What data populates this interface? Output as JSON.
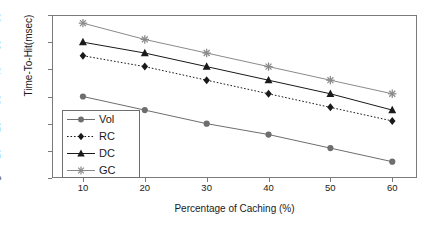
{
  "chart_data": {
    "type": "line",
    "title": "",
    "xlabel": "Percentage of Caching (%)",
    "ylabel": "Time-To-Hit(msec)",
    "x": [
      10,
      20,
      30,
      40,
      50,
      60
    ],
    "xticks": [
      "10",
      "20",
      "30",
      "40",
      "50",
      "60"
    ],
    "yticks": [
      "0",
      "10",
      "20",
      "30",
      "40",
      "50",
      "60"
    ],
    "xlim": [
      5,
      64
    ],
    "ylim": [
      0,
      60
    ],
    "grid": false,
    "legend_position": "bottom-left",
    "series": [
      {
        "name": "Vol",
        "values": [
          30,
          25,
          20,
          16,
          11,
          6
        ],
        "marker": "circle",
        "line_style": "solid",
        "color": "#6e6e6e"
      },
      {
        "name": "RC",
        "values": [
          45,
          41,
          36,
          31,
          26,
          21
        ],
        "marker": "diamond",
        "line_style": "dotted",
        "color": "#1a1a1a"
      },
      {
        "name": "DC",
        "values": [
          50,
          46,
          41,
          36,
          31,
          25
        ],
        "marker": "triangle",
        "line_style": "solid",
        "color": "#1a1a1a"
      },
      {
        "name": "GC",
        "values": [
          57,
          51,
          46,
          41,
          36,
          31
        ],
        "marker": "asterisk",
        "line_style": "solid",
        "color": "#8a8a8a"
      }
    ]
  },
  "legend": {
    "entries": [
      "Vol",
      "RC",
      "DC",
      "GC"
    ]
  },
  "colors": {
    "axis": "#7a7a7a",
    "text": "#1a1a1a",
    "background": "#ffffff"
  }
}
